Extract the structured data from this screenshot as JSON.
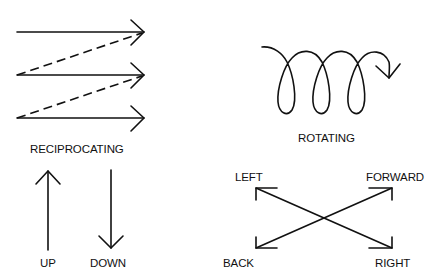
{
  "diagram": {
    "stroke_color": "#111111",
    "background": "#ffffff",
    "panels": {
      "reciprocating": {
        "label": "RECIPROCATING",
        "arrows": [
          {
            "style": "solid",
            "from": [
              17,
              32
            ],
            "to": [
              144,
              32
            ]
          },
          {
            "style": "dashed",
            "from": [
              17,
              75
            ],
            "to": [
              143,
              33
            ]
          },
          {
            "style": "solid",
            "from": [
              17,
              75
            ],
            "to": [
              144,
              75
            ]
          },
          {
            "style": "dashed",
            "from": [
              17,
              118
            ],
            "to": [
              143,
              76
            ]
          },
          {
            "style": "solid",
            "from": [
              17,
              118
            ],
            "to": [
              144,
              118
            ]
          }
        ]
      },
      "rotating": {
        "label": "ROTATING",
        "shape": "helix-with-arrow",
        "loops": 3
      },
      "up_down": {
        "up_label": "UP",
        "down_label": "DOWN"
      },
      "directions": {
        "left_label": "LEFT",
        "forward_label": "FORWARD",
        "back_label": "BACK",
        "right_label": "RIGHT"
      }
    }
  }
}
